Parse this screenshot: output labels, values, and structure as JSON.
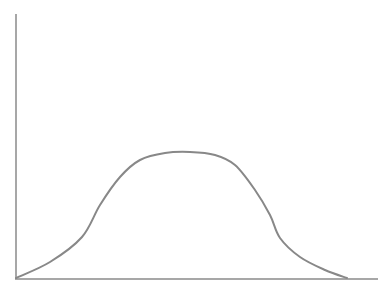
{
  "chart_data": {
    "type": "line",
    "title": "",
    "xlabel": "",
    "ylabel": "",
    "grid": false,
    "legend": null,
    "series": [
      {
        "name": "curve",
        "points_px": [
          [
            16,
            278
          ],
          [
            50,
            262
          ],
          [
            82,
            237
          ],
          [
            100,
            205
          ],
          [
            120,
            177
          ],
          [
            140,
            160
          ],
          [
            165,
            153
          ],
          [
            190,
            152
          ],
          [
            215,
            155
          ],
          [
            235,
            165
          ],
          [
            255,
            190
          ],
          [
            270,
            215
          ],
          [
            280,
            238
          ],
          [
            300,
            257
          ],
          [
            325,
            270
          ],
          [
            347,
            278
          ]
        ]
      }
    ],
    "axes": {
      "origin_px": [
        16,
        278
      ],
      "y_axis_top_px": [
        16,
        14
      ],
      "x_axis_end_px": [
        378,
        279
      ]
    }
  },
  "colors": {
    "axis": "#8a8a8a",
    "curve": "#888888",
    "background": "#ffffff"
  }
}
